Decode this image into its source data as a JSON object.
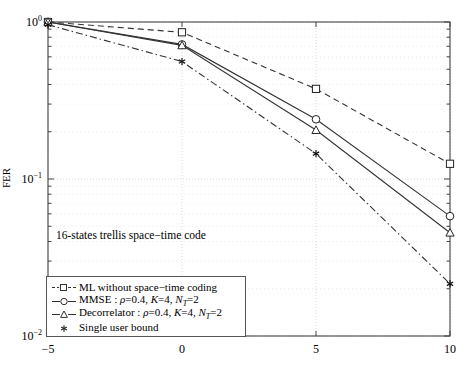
{
  "chart_data": {
    "type": "line",
    "title": "",
    "xlabel": "",
    "ylabel": "FER",
    "xlim": [
      -5,
      10
    ],
    "ylim": [
      0.01,
      1
    ],
    "yscale": "log",
    "grid": true,
    "xticks": [
      "-5",
      "0",
      "5",
      "10"
    ],
    "xtick_values": [
      -5,
      0,
      5,
      10
    ],
    "yticks": [
      "10^0",
      "10^-1",
      "10^-2"
    ],
    "ytick_values": [
      1,
      0.1,
      0.01
    ],
    "legend_position": "lower left",
    "annotation": "16-states trellis space−time code",
    "series": [
      {
        "name": "ML without space−time coding",
        "marker": "square",
        "linestyle": "dashed",
        "x": [
          -5,
          0,
          5,
          10
        ],
        "y": [
          1.0,
          0.86,
          0.375,
          0.125
        ]
      },
      {
        "name": "MMSE : ρ=0.4, K=4, N_T=2",
        "marker": "circle",
        "linestyle": "solid",
        "x": [
          -5,
          0,
          5,
          10
        ],
        "y": [
          1.0,
          0.72,
          0.24,
          0.058
        ]
      },
      {
        "name": "Decorrelator : ρ=0.4, K=4, N_T=2",
        "marker": "triangle",
        "linestyle": "solid",
        "x": [
          -5,
          0,
          5,
          10
        ],
        "y": [
          1.0,
          0.71,
          0.205,
          0.0455
        ]
      },
      {
        "name": "Single user bound",
        "marker": "star",
        "linestyle": "dashdot",
        "x": [
          -5,
          0,
          5,
          10
        ],
        "y": [
          0.96,
          0.56,
          0.145,
          0.0215
        ]
      }
    ]
  },
  "axis": {
    "ylabel": "FER",
    "xticklabels": [
      {
        "text": "−5",
        "x": -5
      },
      {
        "text": "0",
        "x": 0
      },
      {
        "text": "5",
        "x": 5
      },
      {
        "text": "10",
        "x": 10
      }
    ],
    "yticklabels": [
      {
        "base": "10",
        "exp": "0",
        "y": 1
      },
      {
        "base": "10",
        "exp": "−1",
        "y": 0.1
      },
      {
        "base": "10",
        "exp": "−2",
        "y": 0.01
      }
    ]
  },
  "annotation": {
    "text": "16-states trellis space−time code"
  },
  "legend": {
    "items": [
      {
        "label": "ML without space−time coding",
        "marker": "square",
        "line": "dashed"
      },
      {
        "label_pre": "MMSE : ",
        "rho": "ρ",
        "eq1": "=0.4, ",
        "k": "K",
        "eq2": "=4, ",
        "nt": "N",
        "ntsub": "T",
        "eq3": "=2",
        "marker": "circle",
        "line": "solid"
      },
      {
        "label_pre": "Decorrelator : ",
        "rho": "ρ",
        "eq1": "=0.4, ",
        "k": "K",
        "eq2": "=4, ",
        "nt": "N",
        "ntsub": "T",
        "eq3": "=2",
        "marker": "triangle",
        "line": "solid"
      },
      {
        "label": "Single user bound",
        "marker": "star",
        "line": "none"
      }
    ]
  },
  "colors": {
    "axis": "#444444",
    "grid": "#cccccc",
    "line": "#333333",
    "background": "#ffffff"
  }
}
